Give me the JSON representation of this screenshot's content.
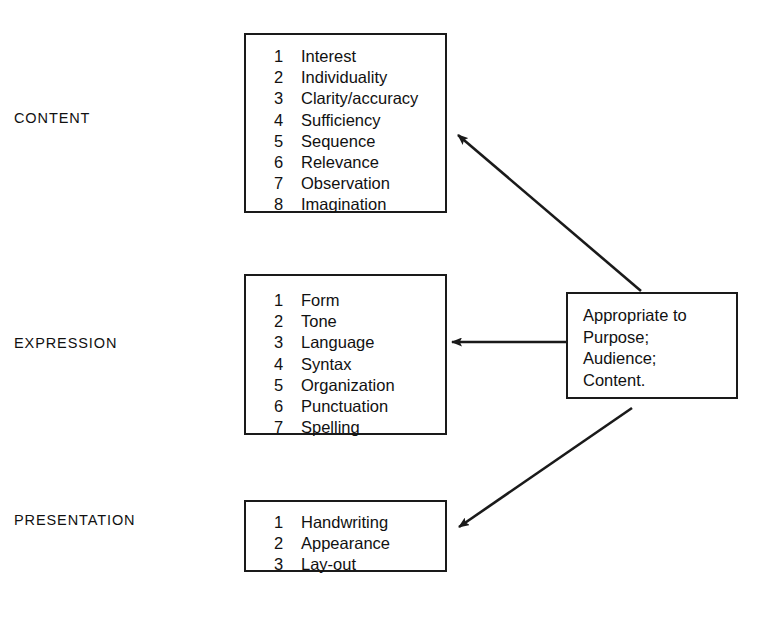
{
  "diagram": {
    "categories": [
      {
        "label": "CONTENT",
        "items": [
          {
            "number": "1",
            "label": "Interest"
          },
          {
            "number": "2",
            "label": "Individuality"
          },
          {
            "number": "3",
            "label": "Clarity/accuracy"
          },
          {
            "number": "4",
            "label": "Sufficiency"
          },
          {
            "number": "5",
            "label": "Sequence"
          },
          {
            "number": "6",
            "label": "Relevance"
          },
          {
            "number": "7",
            "label": "Observation"
          },
          {
            "number": "8",
            "label": "Imagination"
          }
        ]
      },
      {
        "label": "EXPRESSION",
        "items": [
          {
            "number": "1",
            "label": "Form"
          },
          {
            "number": "2",
            "label": "Tone"
          },
          {
            "number": "3",
            "label": "Language"
          },
          {
            "number": "4",
            "label": "Syntax"
          },
          {
            "number": "5",
            "label": "Organization"
          },
          {
            "number": "6",
            "label": "Punctuation"
          },
          {
            "number": "7",
            "label": "Spelling"
          }
        ]
      },
      {
        "label": "PRESENTATION",
        "items": [
          {
            "number": "1",
            "label": "Handwriting"
          },
          {
            "number": "2",
            "label": "Appearance"
          },
          {
            "number": "3",
            "label": "Lay-out"
          }
        ]
      }
    ],
    "summary": {
      "lines": [
        "Appropriate to",
        "Purpose;",
        "Audience;",
        "Content."
      ]
    },
    "colors": {
      "background": "#ffffff",
      "stroke": "#1a1a1a",
      "text": "#111111"
    },
    "connectors": [
      {
        "name": "summary-to-content",
        "direction": "up-left",
        "from": "summary-box-top",
        "to": "content-box-right"
      },
      {
        "name": "summary-to-expression",
        "direction": "left",
        "from": "summary-box-left",
        "to": "expression-box-right"
      },
      {
        "name": "summary-to-presentation",
        "direction": "down-left",
        "from": "summary-box-bottom",
        "to": "presentation-box-right"
      }
    ]
  }
}
